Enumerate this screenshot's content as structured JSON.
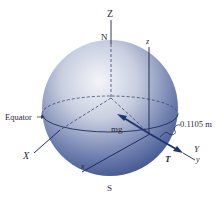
{
  "figure": {
    "labels": {
      "Z_axis": "Z",
      "north": "N",
      "south": "S",
      "z_local": "z",
      "equator": "Equator",
      "X_axis": "X",
      "x_local": "x",
      "Y_axis": "Y",
      "y_local": "y",
      "weight": "mg",
      "tension": "T",
      "offset_distance": "0.1105 m"
    },
    "colors": {
      "sphere_light": "#eef0f5",
      "sphere_mid": "#8d9ac0",
      "sphere_dark": "#2f4583",
      "vector": "#1f3571",
      "axis_line": "#333a55",
      "text": "#2a2a3a"
    }
  }
}
